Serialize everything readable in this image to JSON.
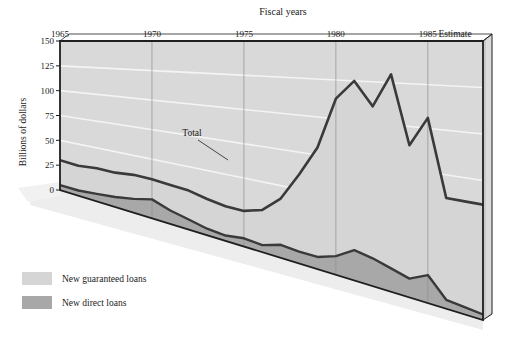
{
  "chart_data": {
    "type": "area",
    "title": "Fiscal years",
    "xlabel": "Fiscal years",
    "ylabel": "Billions of dollars",
    "ylim": [
      0,
      150
    ],
    "yticks": [
      0,
      25,
      50,
      75,
      100,
      125,
      150
    ],
    "xlim": [
      1965,
      1988
    ],
    "xticks": [
      1965,
      1970,
      1975,
      1980,
      1985
    ],
    "xtick_labels": [
      "1965",
      "1970",
      "1975",
      "1980",
      "1985"
    ],
    "estimate_label": "Estimate",
    "grid": true,
    "legend_position": "below-left",
    "annotations": [
      {
        "text": "Total",
        "x": 1974,
        "y": 62
      }
    ],
    "x": [
      1965,
      1966,
      1967,
      1968,
      1969,
      1970,
      1971,
      1972,
      1973,
      1974,
      1975,
      1976,
      1977,
      1978,
      1979,
      1980,
      1981,
      1982,
      1983,
      1984,
      1985,
      1986,
      1987,
      1988
    ],
    "series": [
      {
        "name": "New direct loans",
        "color": "#a8a8a8",
        "values": [
          5,
          5,
          7,
          9,
          12,
          16,
          11,
          8,
          5,
          4,
          6,
          5,
          9,
          8,
          8,
          12,
          19,
          17,
          14,
          11,
          16,
          5,
          4,
          3
        ]
      },
      {
        "name": "New guaranteed loans",
        "color": "#d5d5d5",
        "values": [
          25,
          24,
          24,
          22,
          21,
          17,
          21,
          23,
          23,
          22,
          20,
          25,
          32,
          52,
          72,
          101,
          106,
          93,
          116,
          78,
          90,
          57,
          58,
          59
        ]
      }
    ],
    "total": {
      "name": "Total",
      "color": "#3a3a3a",
      "values": [
        30,
        29,
        31,
        31,
        33,
        33,
        32,
        31,
        28,
        26,
        26,
        30,
        41,
        60,
        80,
        113,
        125,
        110,
        130,
        89,
        106,
        62,
        62,
        62
      ]
    }
  },
  "legend": {
    "items": [
      {
        "label": "New guaranteed loans",
        "swatch": "#d5d5d5"
      },
      {
        "label": "New direct loans",
        "swatch": "#a8a8a8"
      }
    ]
  },
  "colors": {
    "guaranteed_fill": "#d5d5d5",
    "direct_fill": "#a8a8a8",
    "line": "#3a3a3a",
    "grid": "#f2f2f2",
    "vgrid": "#9a9a9a",
    "frame": "#1f1f1f",
    "side_panel": "#c9c9c9",
    "side_panel_edge": "#e2e2e2",
    "shadow": "#ededed",
    "background": "#ffffff"
  }
}
